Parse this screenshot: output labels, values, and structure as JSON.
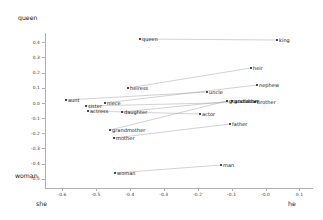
{
  "axes": {
    "y_top_label": "queen",
    "y_bottom_label": "woman",
    "x_left_label": "she",
    "x_right_label": "he",
    "y_ticks": [
      "0.4",
      "0.3",
      "0.2",
      "0.1",
      "0.0",
      "-0.1",
      "-0.2",
      "-0.3",
      "-0.4",
      "-0.5"
    ],
    "x_ticks": [
      "-0.6",
      "-0.5",
      "-0.4",
      "-0.3",
      "-0.2",
      "-0.1",
      "-0.0",
      "0.1"
    ]
  },
  "chart_data": {
    "type": "scatter",
    "title": "",
    "xlabel": "she → he",
    "ylabel": "woman → queen",
    "xlim": [
      -0.65,
      0.14
    ],
    "ylim": [
      -0.56,
      0.46
    ],
    "grid": false,
    "legend": "none",
    "xticks": [
      -0.6,
      -0.5,
      -0.4,
      -0.3,
      -0.2,
      -0.1,
      -0.0,
      0.1
    ],
    "yticks": [
      0.4,
      0.3,
      0.2,
      0.1,
      0.0,
      -0.1,
      -0.2,
      -0.3,
      -0.4,
      -0.5
    ],
    "points": [
      {
        "label": "queen",
        "x": -0.315,
        "y": 0.4,
        "px": 140,
        "py": 39
      },
      {
        "label": "king",
        "x": 0.082,
        "y": 0.368,
        "px": 277,
        "py": 40
      },
      {
        "label": "heiress",
        "x": -0.368,
        "y": 0.04,
        "px": 128,
        "py": 88
      },
      {
        "label": "heir",
        "x": 0.003,
        "y": 0.148,
        "px": 251,
        "py": 68
      },
      {
        "label": "nephew",
        "x": 0.02,
        "y": 0.01,
        "px": 257,
        "py": 85
      },
      {
        "label": "uncle",
        "x": -0.12,
        "y": -0.022,
        "px": 207,
        "py": 92
      },
      {
        "label": "grandfather",
        "x": -0.055,
        "y": -0.07,
        "px": 227,
        "py": 101
      },
      {
        "label": "grandson",
        "x": -0.048,
        "y": -0.07,
        "px": 232,
        "py": 101
      },
      {
        "label": "brother",
        "x": 0.008,
        "y": -0.073,
        "px": 255,
        "py": 102
      },
      {
        "label": "aunt",
        "x": -0.545,
        "y": -0.058,
        "px": 66,
        "py": 100
      },
      {
        "label": "sister",
        "x": -0.48,
        "y": -0.09,
        "px": 86,
        "py": 106
      },
      {
        "label": "niece",
        "x": -0.455,
        "y": -0.075,
        "px": 105,
        "py": 103
      },
      {
        "label": "actress",
        "x": -0.468,
        "y": -0.105,
        "px": 88,
        "py": 111
      },
      {
        "label": "daughter",
        "x": -0.4,
        "y": -0.105,
        "px": 122,
        "py": 112
      },
      {
        "label": "actor",
        "x": -0.14,
        "y": -0.122,
        "px": 200,
        "py": 114
      },
      {
        "label": "father",
        "x": -0.072,
        "y": -0.15,
        "px": 230,
        "py": 124
      },
      {
        "label": "grandmother",
        "x": -0.41,
        "y": -0.168,
        "px": 110,
        "py": 130
      },
      {
        "label": "mother",
        "x": -0.395,
        "y": -0.192,
        "px": 114,
        "py": 138
      },
      {
        "label": "woman",
        "x": -0.392,
        "y": -0.45,
        "px": 115,
        "py": 173
      },
      {
        "label": "man",
        "x": -0.098,
        "y": -0.408,
        "px": 221,
        "py": 165
      }
    ],
    "pairs": [
      {
        "female": "queen",
        "male": "king"
      },
      {
        "female": "heiress",
        "male": "heir"
      },
      {
        "female": "niece",
        "male": "nephew"
      },
      {
        "female": "aunt",
        "male": "uncle"
      },
      {
        "female": "grandmother",
        "male": "grandfather"
      },
      {
        "female": "daughter",
        "male": "grandson"
      },
      {
        "female": "sister",
        "male": "brother"
      },
      {
        "female": "actress",
        "male": "actor"
      },
      {
        "female": "mother",
        "male": "father"
      },
      {
        "female": "woman",
        "male": "man"
      }
    ]
  }
}
